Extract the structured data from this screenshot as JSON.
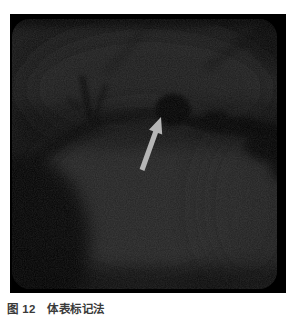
{
  "figure": {
    "caption": {
      "label": "图 12",
      "title": "体表标记法"
    }
  },
  "colors": {
    "page_background": "#ffffff",
    "image_frame": "#000000",
    "annotation_arrow": "#b5b5b5",
    "caption_text": "#3a3a3a"
  }
}
